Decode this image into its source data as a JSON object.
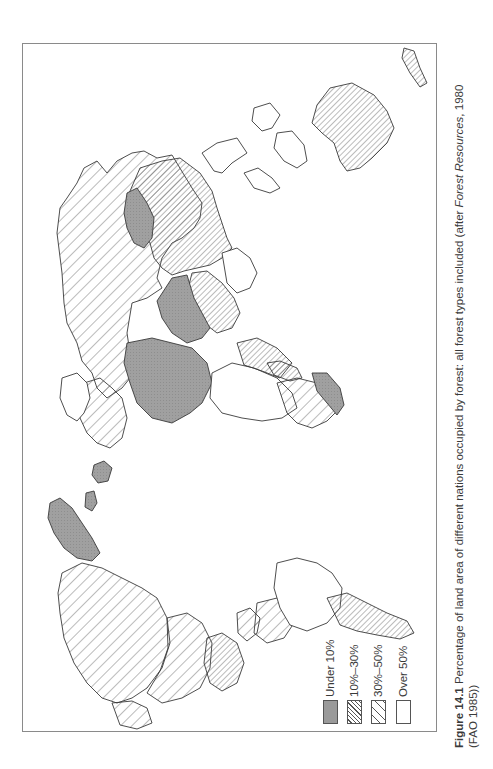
{
  "figure": {
    "number_label": "Figure 14.1",
    "caption_line1_pre": "Percentage of land area of different nations occupied by forest: all forest types included (after ",
    "caption_line1_italic": "Forest Resources",
    "caption_line1_post": ", 1980",
    "caption_line2": "(FAO 1985))",
    "orientation": "rotated 90° (north to the left)"
  },
  "legend": {
    "items": [
      {
        "label": "Under 10%",
        "pattern": "solid-grey",
        "color": "#9a9a9a"
      },
      {
        "label": "10%–30%",
        "pattern": "dense-hatch",
        "color": "#555555"
      },
      {
        "label": "30%–50%",
        "pattern": "sparse-hatch",
        "color": "#555555"
      },
      {
        "label": "Over 50%",
        "pattern": "blank",
        "color": "#ffffff"
      }
    ]
  },
  "map": {
    "title": "World forest cover by nation",
    "categories": [
      "Under 10%",
      "10%–30%",
      "30%–50%",
      "Over 50%"
    ],
    "regions": [
      {
        "name": "USSR",
        "class": "30%–50%"
      },
      {
        "name": "China",
        "class": "10%–30%"
      },
      {
        "name": "Mongolia",
        "class": "Under 10%"
      },
      {
        "name": "Middle East / Arabia",
        "class": "Under 10%"
      },
      {
        "name": "North Africa (Sahara)",
        "class": "Under 10%"
      },
      {
        "name": "India",
        "class": "10%–30%"
      },
      {
        "name": "Southeast Asia",
        "class": "Over 50%"
      },
      {
        "name": "Indonesia",
        "class": "Over 50%"
      },
      {
        "name": "Australia",
        "class": "10%–30%"
      },
      {
        "name": "New Zealand",
        "class": "10%–30%"
      },
      {
        "name": "Central Africa",
        "class": "Over 50%"
      },
      {
        "name": "Southern Africa",
        "class": "10%–30%"
      },
      {
        "name": "South Africa",
        "class": "Under 10%"
      },
      {
        "name": "Madagascar",
        "class": "10%–30%"
      },
      {
        "name": "Scandinavia",
        "class": "Over 50%"
      },
      {
        "name": "Western Europe",
        "class": "10%–30%"
      },
      {
        "name": "British Isles",
        "class": "Under 10%"
      },
      {
        "name": "Greenland",
        "class": "Under 10%"
      },
      {
        "name": "Canada",
        "class": "30%–50%"
      },
      {
        "name": "USA",
        "class": "30%–50%"
      },
      {
        "name": "Alaska",
        "class": "30%–50%"
      },
      {
        "name": "Mexico",
        "class": "10%–30%"
      },
      {
        "name": "Central America",
        "class": "30%–50%"
      },
      {
        "name": "Brazil",
        "class": "Over 50%"
      },
      {
        "name": "Argentina",
        "class": "10%–30%"
      },
      {
        "name": "Andean nations",
        "class": "30%–50%"
      },
      {
        "name": "Japan",
        "class": "Over 50%"
      }
    ]
  }
}
